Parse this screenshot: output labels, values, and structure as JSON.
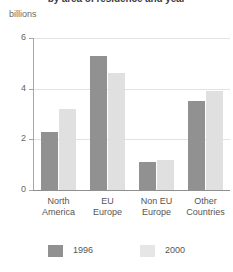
{
  "chart_data": {
    "type": "bar",
    "title": "by area of residence and year",
    "subtitle": "billions",
    "xlabel": "",
    "ylabel": "billions",
    "ylim": [
      0,
      6
    ],
    "yticks": [
      "0",
      "2",
      "4",
      "6"
    ],
    "grid": true,
    "legend_position": "bottom",
    "categories": [
      "North America",
      "EU Europe",
      "Non EU Europe",
      "Other Countries"
    ],
    "category_lines": [
      [
        "North",
        "America"
      ],
      [
        "EU",
        "Europe"
      ],
      [
        "Non EU",
        "Europe"
      ],
      [
        "Other",
        "Countries"
      ]
    ],
    "series": [
      {
        "name": "1996",
        "color": "#919191",
        "values": [
          2.3,
          5.3,
          1.1,
          3.5
        ]
      },
      {
        "name": "2000",
        "color": "#e0e0e0",
        "values": [
          3.2,
          4.6,
          1.2,
          3.9
        ]
      }
    ]
  },
  "legend": {
    "items": [
      {
        "label": "1996",
        "swatch": "legend-swatch-1996"
      },
      {
        "label": "2000",
        "swatch": "legend-swatch-2000"
      }
    ]
  }
}
